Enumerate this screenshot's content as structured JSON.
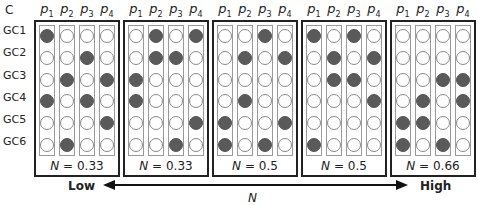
{
  "panel_letter": "C",
  "row_labels": [
    "GC1",
    "GC2",
    "GC3",
    "GC4",
    "GC5",
    "GC6"
  ],
  "col_labels": [
    {
      "base": "p",
      "sub": "1"
    },
    {
      "base": "p",
      "sub": "2"
    },
    {
      "base": "p",
      "sub": "3"
    },
    {
      "base": "p",
      "sub": "4"
    }
  ],
  "panels": [
    {
      "n_symbol": "N",
      "n_value": "= 0.33",
      "grid": [
        [
          1,
          0,
          0,
          0
        ],
        [
          0,
          0,
          1,
          0
        ],
        [
          0,
          1,
          0,
          1
        ],
        [
          1,
          0,
          1,
          0
        ],
        [
          0,
          0,
          0,
          1
        ],
        [
          0,
          1,
          0,
          0
        ]
      ]
    },
    {
      "n_symbol": "N",
      "n_value": "= 0.33",
      "grid": [
        [
          0,
          1,
          0,
          1
        ],
        [
          0,
          1,
          1,
          0
        ],
        [
          1,
          0,
          0,
          0
        ],
        [
          1,
          0,
          0,
          0
        ],
        [
          0,
          0,
          0,
          1
        ],
        [
          0,
          0,
          1,
          0
        ]
      ]
    },
    {
      "n_symbol": "N",
      "n_value": "= 0.5",
      "grid": [
        [
          0,
          0,
          1,
          0
        ],
        [
          0,
          1,
          0,
          1
        ],
        [
          0,
          0,
          0,
          0
        ],
        [
          0,
          1,
          0,
          0
        ],
        [
          1,
          0,
          0,
          1
        ],
        [
          1,
          0,
          1,
          0
        ]
      ]
    },
    {
      "n_symbol": "N",
      "n_value": "= 0.5",
      "grid": [
        [
          1,
          0,
          1,
          0
        ],
        [
          0,
          1,
          0,
          1
        ],
        [
          0,
          1,
          1,
          0
        ],
        [
          0,
          0,
          0,
          1
        ],
        [
          0,
          0,
          0,
          0
        ],
        [
          1,
          0,
          0,
          0
        ]
      ]
    },
    {
      "n_symbol": "N",
      "n_value": "= 0.66",
      "grid": [
        [
          0,
          0,
          0,
          0
        ],
        [
          0,
          0,
          0,
          0
        ],
        [
          0,
          0,
          1,
          1
        ],
        [
          0,
          1,
          0,
          1
        ],
        [
          1,
          1,
          0,
          0
        ],
        [
          1,
          0,
          1,
          0
        ]
      ]
    }
  ],
  "axis": {
    "low": "Low",
    "high": "High",
    "label": "N"
  },
  "colors": {
    "filled": "#5a5a5a",
    "empty": "#ffffff",
    "border": "#222222"
  }
}
